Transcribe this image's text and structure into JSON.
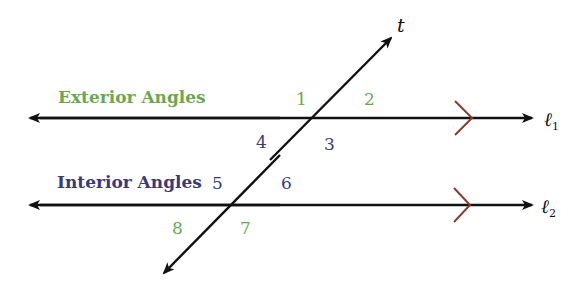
{
  "colors": {
    "exterior": "#6aa84f",
    "interior": "#3b3a78",
    "line": "#111111",
    "parallel_mark": "#8a3b2e"
  },
  "headings": {
    "exterior": "Exterior Angles",
    "interior": "Interior Angles"
  },
  "lines": {
    "transversal": "t",
    "l1": {
      "symbol": "ℓ",
      "sub": "1"
    },
    "l2": {
      "symbol": "ℓ",
      "sub": "2"
    }
  },
  "angles": {
    "a1": "1",
    "a2": "2",
    "a3": "3",
    "a4": "4",
    "a5": "5",
    "a6": "6",
    "a7": "7",
    "a8": "8"
  }
}
